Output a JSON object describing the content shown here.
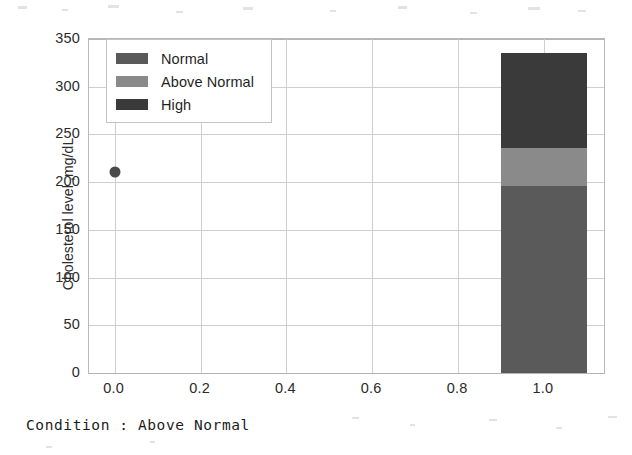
{
  "caption": "Condition : Above Normal",
  "legend": {
    "position": "upper-left-inside",
    "entries": [
      {
        "label": "Normal",
        "color": "#5a5a5a"
      },
      {
        "label": "Above Normal",
        "color": "#8a8a8a"
      },
      {
        "label": "High",
        "color": "#3a3a3a"
      }
    ]
  },
  "chart_data": {
    "type": "bar",
    "title": "",
    "subtitle": "",
    "xlabel": "",
    "ylabel": "Cholesterol level ,mg/dL",
    "stacked": true,
    "orientation": "vertical",
    "grid": true,
    "xlim": [
      -0.06,
      1.14
    ],
    "ylim": [
      0,
      350
    ],
    "xticks": [
      0.0,
      0.2,
      0.4,
      0.6,
      0.8,
      1.0
    ],
    "xticklabels": [
      "0.0",
      "0.2",
      "0.4",
      "0.6",
      "0.8",
      "1.0"
    ],
    "yticks": [
      0,
      50,
      100,
      150,
      200,
      250,
      300,
      350
    ],
    "yticklabels": [
      "0",
      "50",
      "100",
      "150",
      "200",
      "250",
      "300",
      "350"
    ],
    "categories": [
      "1.0"
    ],
    "bar_x_center": 1.0,
    "bar_width": 0.2,
    "series": [
      {
        "name": "Normal",
        "values": [
          196
        ],
        "color": "#5a5a5a"
      },
      {
        "name": "Above Normal",
        "values": [
          40
        ],
        "color": "#8a8a8a"
      },
      {
        "name": "High",
        "values": [
          99
        ],
        "color": "#3a3a3a"
      }
    ],
    "stack_tops": [
      196,
      236,
      335
    ],
    "bar_total": 335,
    "overlay_points": [
      {
        "x": 0.0,
        "y": 211,
        "color": "#4a4a4a",
        "marker": "circle"
      }
    ],
    "annotations": []
  }
}
